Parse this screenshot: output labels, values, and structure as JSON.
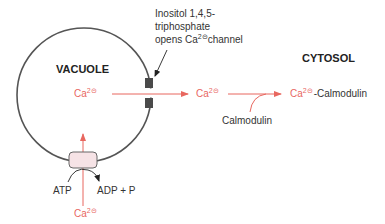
{
  "colors": {
    "membrane": "#555555",
    "calcium": "#e8675f",
    "channel": "#4a4a4a",
    "transporter_fill": "#f6e3e6",
    "transporter_stroke": "#666666",
    "text": "#333333"
  },
  "compartments": {
    "vacuole": "VACUOLE",
    "cytosol": "CYTOSOL"
  },
  "channel_annotation": {
    "line1": "Inositol 1,4,5-",
    "line2": "triphosphate",
    "line3_pre": "opens Ca",
    "line3_sup": "2⊝",
    "line3_post": "channel"
  },
  "ions": {
    "ca_base": "Ca",
    "ca_charge": "2⊝"
  },
  "complex_suffix": "-Calmodulin",
  "calmodulin": "Calmodulin",
  "pump": {
    "atp": "ATP",
    "products": "ADP + P"
  }
}
